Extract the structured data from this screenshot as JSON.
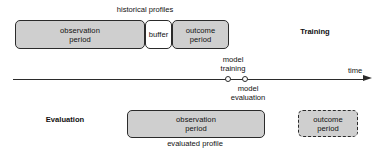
{
  "diagram": {
    "title": "historical profiles",
    "top_row": {
      "group_label": "historical profiles",
      "phase_label": "Training",
      "boxes": [
        {
          "name": "observation-period",
          "label": "observation\nperiod",
          "style": "filled"
        },
        {
          "name": "buffer",
          "label": "buffer",
          "style": "outline"
        },
        {
          "name": "outcome-period",
          "label": "outcome\nperiod",
          "style": "filled"
        }
      ]
    },
    "timeline": {
      "axis_label": "time",
      "markers": [
        {
          "name": "model-training",
          "label": "model\ntraining"
        },
        {
          "name": "model-evaluation",
          "label": "model\nevaluation"
        }
      ],
      "arrow_direction": "right"
    },
    "bottom_row": {
      "phase_label": "Evaluation",
      "group_label": "evaluated profile",
      "boxes": [
        {
          "name": "observation-period",
          "label": "observation\nperiod",
          "style": "filled"
        },
        {
          "name": "outcome-period",
          "label": "outcome\nperiod",
          "style": "dashed"
        }
      ]
    },
    "colors": {
      "box_fill": "#cfcfcf",
      "box_fill_light": "#ffffff",
      "stroke": "#2b2b2b",
      "text": "#111111",
      "background": "#ffffff"
    }
  }
}
